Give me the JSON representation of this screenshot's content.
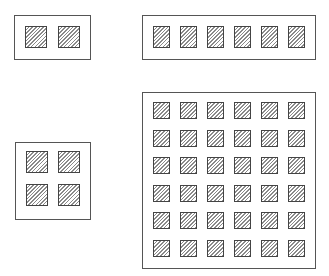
{
  "diagram": {
    "colors": {
      "outline": "#555555",
      "cell_border": "#444444",
      "hatch": "#8a8a8a",
      "background": "#ffffff"
    },
    "boxes": [
      {
        "id": "box-1x2",
        "rows": 1,
        "cols": 2,
        "x": 14,
        "y": 15,
        "w": 77,
        "h": 45,
        "cell": {
          "w": 22,
          "h": 22,
          "x0": 25,
          "y0": 26,
          "dx": 33,
          "dy": 0
        }
      },
      {
        "id": "box-1x6",
        "rows": 1,
        "cols": 6,
        "x": 142,
        "y": 15,
        "w": 174,
        "h": 45,
        "cell": {
          "w": 17,
          "h": 22,
          "x0": 153,
          "y0": 26,
          "dx": 27,
          "dy": 0
        }
      },
      {
        "id": "box-2x2",
        "rows": 2,
        "cols": 2,
        "x": 15,
        "y": 142,
        "w": 76,
        "h": 78,
        "cell": {
          "w": 22,
          "h": 22,
          "x0": 26,
          "y0": 151,
          "dx": 32,
          "dy": 33
        }
      },
      {
        "id": "box-6x6",
        "rows": 6,
        "cols": 6,
        "x": 142,
        "y": 92,
        "w": 174,
        "h": 177,
        "cell": {
          "w": 17,
          "h": 17,
          "x0": 153,
          "y0": 102,
          "dx": 27,
          "dy": 27.6
        }
      }
    ]
  }
}
